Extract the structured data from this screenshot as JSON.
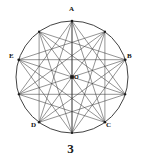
{
  "figure": {
    "caption": "3",
    "background_color": "#ffffff",
    "stroke_color": "#3a3a3a",
    "circle_stroke_color": "#2e2e2e",
    "label_color": "#111111",
    "center": {
      "cx": 72,
      "cy": 77,
      "r": 56
    },
    "center_point": {
      "label": "O",
      "x": 72,
      "y": 77
    },
    "vertices": [
      {
        "id": "V0",
        "label": "A",
        "angle_deg": 90,
        "x": 72,
        "y": 21,
        "labeled": true,
        "label_x": 69,
        "label_y": 8
      },
      {
        "id": "V1",
        "label": "",
        "angle_deg": 54,
        "x": 104.9,
        "y": 31.7,
        "labeled": false,
        "label_x": 0,
        "label_y": 0
      },
      {
        "id": "V2",
        "label": "B",
        "angle_deg": 18,
        "x": 125.3,
        "y": 59.7,
        "labeled": true,
        "label_x": 127,
        "label_y": 53
      },
      {
        "id": "V3",
        "label": "",
        "angle_deg": -18,
        "x": 125.3,
        "y": 94.3,
        "labeled": false,
        "label_x": 0,
        "label_y": 0
      },
      {
        "id": "V4",
        "label": "C",
        "angle_deg": -54,
        "x": 104.9,
        "y": 122.3,
        "labeled": true,
        "label_x": 106,
        "label_y": 122
      },
      {
        "id": "V5",
        "label": "",
        "angle_deg": -90,
        "x": 72,
        "y": 133,
        "labeled": false,
        "label_x": 0,
        "label_y": 0
      },
      {
        "id": "V6",
        "label": "D",
        "angle_deg": -126,
        "x": 39.1,
        "y": 122.3,
        "labeled": true,
        "label_x": 31,
        "label_y": 122
      },
      {
        "id": "V7",
        "label": "",
        "angle_deg": 198,
        "x": 18.7,
        "y": 94.3,
        "labeled": false,
        "label_x": 0,
        "label_y": 0
      },
      {
        "id": "V8",
        "label": "E",
        "angle_deg": 162,
        "x": 18.7,
        "y": 59.7,
        "labeled": true,
        "label_x": 9,
        "label_y": 53
      },
      {
        "id": "V9",
        "label": "",
        "angle_deg": 126,
        "x": 39.1,
        "y": 31.7,
        "labeled": false,
        "label_x": 0,
        "label_y": 0
      }
    ],
    "chord_steps": [
      3,
      4,
      5
    ],
    "labels_visible": [
      "A",
      "B",
      "C",
      "D",
      "E",
      "O"
    ]
  }
}
